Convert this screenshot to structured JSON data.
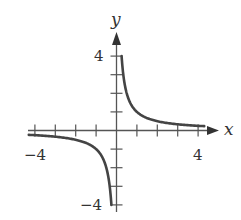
{
  "chart_data": {
    "type": "line",
    "title": "",
    "function": "y = 1/x",
    "xlabel": "x",
    "ylabel": "y",
    "xlim": [
      -4.3,
      4.5
    ],
    "ylim": [
      -4.3,
      5.2
    ],
    "grid": false,
    "legend": null,
    "x_ticks": [
      -4,
      -3,
      -2,
      -1,
      1,
      2,
      3,
      4
    ],
    "y_ticks": [
      -4,
      -3,
      -2,
      -1,
      1,
      2,
      3,
      4
    ],
    "x_tick_labels": [
      {
        "value": -4,
        "label": "−4"
      },
      {
        "value": 4,
        "label": "4"
      }
    ],
    "y_tick_labels": [
      {
        "value": 4,
        "label": "4"
      },
      {
        "value": -4,
        "label": "−4"
      }
    ],
    "series": [
      {
        "name": "right-branch",
        "x": [
          0.25,
          0.3,
          0.4,
          0.5,
          0.75,
          1,
          1.5,
          2,
          2.5,
          3,
          3.5,
          4,
          4.3
        ],
        "y": [
          4,
          3.33,
          2.5,
          2,
          1.33,
          1,
          0.67,
          0.5,
          0.4,
          0.33,
          0.29,
          0.25,
          0.23
        ]
      },
      {
        "name": "left-branch",
        "x": [
          -4.3,
          -4,
          -3.5,
          -3,
          -2.5,
          -2,
          -1.5,
          -1,
          -0.75,
          -0.5,
          -0.4,
          -0.3,
          -0.25
        ],
        "y": [
          -0.23,
          -0.25,
          -0.29,
          -0.33,
          -0.4,
          -0.5,
          -0.67,
          -1,
          -1.33,
          -2,
          -2.5,
          -3.33,
          -4
        ]
      }
    ],
    "style": {
      "curve_color": "#444444",
      "axis_color": "#555555"
    }
  },
  "labels": {
    "x_axis": "x",
    "y_axis": "y",
    "x_neg": "−4",
    "x_pos": "4",
    "y_pos": "4",
    "y_neg": "−4"
  }
}
